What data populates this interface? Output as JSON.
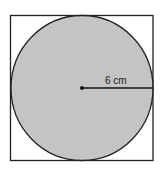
{
  "diagram": {
    "shape": "circle inscribed in square",
    "radius_label": "6 cm",
    "colors": {
      "circle_fill": "#c4c4c4",
      "stroke": "#222222",
      "background": "#ffffff"
    }
  }
}
